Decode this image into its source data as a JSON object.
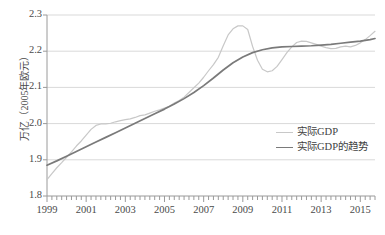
{
  "chart_data": {
    "type": "line",
    "title": "",
    "xlabel": "",
    "ylabel": "万亿（2005年欧元）",
    "xlim": [
      1999,
      2015.75
    ],
    "ylim": [
      1.8,
      2.3
    ],
    "yticks": [
      "1.8",
      "1.9",
      "2.0",
      "2.1",
      "2.2",
      "2.3"
    ],
    "ytick_values": [
      1.8,
      1.9,
      2.0,
      2.1,
      2.2,
      2.3
    ],
    "xticks": [
      "1999",
      "2001",
      "2003",
      "2005",
      "2007",
      "2009",
      "2011",
      "2013",
      "2015"
    ],
    "xtick_values": [
      1999,
      2001,
      2003,
      2005,
      2007,
      2009,
      2011,
      2013,
      2015
    ],
    "minor_tick_interval": 0.25,
    "grid": "horizontal",
    "legend_position": "center-right",
    "colors": {
      "actual": "#c8c8c8",
      "trend": "#7a7a7a",
      "grid": "#d9d9d9",
      "axis": "#9a9a9a",
      "text": "#4a4a4a"
    },
    "series": [
      {
        "name": "实际GDP",
        "color": "#c8c8c8",
        "x": [
          1999,
          1999.25,
          1999.5,
          1999.75,
          2000,
          2000.25,
          2000.5,
          2000.75,
          2001,
          2001.25,
          2001.5,
          2001.75,
          2002,
          2002.25,
          2002.5,
          2002.75,
          2003,
          2003.25,
          2003.5,
          2003.75,
          2004,
          2004.25,
          2004.5,
          2004.75,
          2005,
          2005.25,
          2005.5,
          2005.75,
          2006,
          2006.25,
          2006.5,
          2006.75,
          2007,
          2007.25,
          2007.5,
          2007.75,
          2008,
          2008.25,
          2008.5,
          2008.75,
          2009,
          2009.25,
          2009.5,
          2009.75,
          2010,
          2010.25,
          2010.5,
          2010.75,
          2011,
          2011.25,
          2011.5,
          2011.75,
          2012,
          2012.25,
          2012.5,
          2012.75,
          2013,
          2013.25,
          2013.5,
          2013.75,
          2014,
          2014.25,
          2014.5,
          2014.75,
          2015,
          2015.25,
          2015.5,
          2015.75
        ],
        "y": [
          1.845,
          1.862,
          1.878,
          1.892,
          1.907,
          1.922,
          1.938,
          1.952,
          1.968,
          1.984,
          1.995,
          1.999,
          1.999,
          2.001,
          2.005,
          2.008,
          2.011,
          2.013,
          2.017,
          2.022,
          2.024,
          2.029,
          2.034,
          2.038,
          2.043,
          2.048,
          2.057,
          2.064,
          2.073,
          2.086,
          2.099,
          2.112,
          2.128,
          2.146,
          2.163,
          2.183,
          2.215,
          2.245,
          2.262,
          2.27,
          2.27,
          2.26,
          2.213,
          2.175,
          2.15,
          2.143,
          2.146,
          2.158,
          2.177,
          2.196,
          2.212,
          2.224,
          2.228,
          2.227,
          2.223,
          2.219,
          2.214,
          2.21,
          2.207,
          2.208,
          2.212,
          2.214,
          2.212,
          2.216,
          2.223,
          2.232,
          2.243,
          2.255
        ]
      },
      {
        "name": "实际GDP的趋势",
        "color": "#7a7a7a",
        "x": [
          1999,
          1999.5,
          2000,
          2000.5,
          2001,
          2001.5,
          2002,
          2002.5,
          2003,
          2003.5,
          2004,
          2004.5,
          2005,
          2005.5,
          2006,
          2006.5,
          2007,
          2007.5,
          2008,
          2008.5,
          2009,
          2009.5,
          2010,
          2010.5,
          2011,
          2011.5,
          2012,
          2012.5,
          2013,
          2013.5,
          2014,
          2014.5,
          2015,
          2015.5,
          2015.75
        ],
        "y": [
          1.885,
          1.897,
          1.91,
          1.923,
          1.936,
          1.949,
          1.962,
          1.975,
          1.988,
          2.001,
          2.014,
          2.027,
          2.04,
          2.054,
          2.069,
          2.086,
          2.105,
          2.126,
          2.148,
          2.168,
          2.184,
          2.196,
          2.204,
          2.209,
          2.212,
          2.213,
          2.214,
          2.215,
          2.217,
          2.219,
          2.222,
          2.225,
          2.228,
          2.232,
          2.235
        ]
      }
    ]
  },
  "legend": {
    "items": [
      {
        "label": "实际GDP"
      },
      {
        "label": "实际GDP的趋势"
      }
    ]
  },
  "caption": {
    "text": ""
  }
}
